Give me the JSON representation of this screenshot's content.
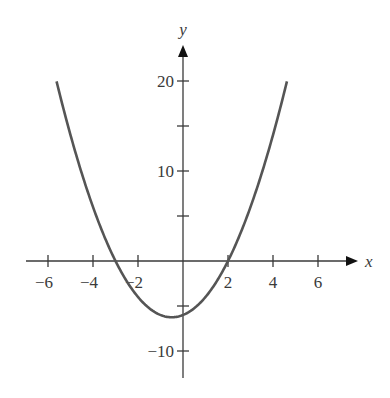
{
  "chart_data": {
    "type": "line",
    "title": "",
    "xlabel": "x",
    "ylabel": "y",
    "function": "y = x^2 + x - 6",
    "xlim": [
      -7,
      7.8
    ],
    "ylim": [
      -13,
      24
    ],
    "x_ticks": [
      -6,
      -4,
      -2,
      2,
      4,
      6
    ],
    "x_tick_labels": [
      "−6",
      "−4",
      "−2",
      "2",
      "4",
      "6"
    ],
    "y_ticks": [
      -10,
      -5,
      5,
      10,
      15,
      20
    ],
    "y_tick_labels": [
      {
        "value": 20,
        "label": "20"
      },
      {
        "value": 10,
        "label": "10"
      },
      {
        "value": -10,
        "label": "−10"
      }
    ],
    "grid": false,
    "legend": null,
    "series": [
      {
        "name": "parabola",
        "color": "#555555",
        "domain": [
          -5.62,
          4.62
        ],
        "x": [
          -5.62,
          -5,
          -4,
          -3,
          -2,
          -1,
          -0.5,
          0,
          1,
          2,
          3,
          4,
          4.62
        ],
        "y": [
          20,
          14,
          6,
          0,
          -4,
          -6,
          -6.25,
          -6,
          -4,
          0,
          6,
          14,
          20
        ]
      }
    ],
    "x_intercepts": [
      -3,
      2
    ],
    "vertex": [
      -0.5,
      -6.25
    ],
    "y_intercept": -6
  },
  "layout": {
    "origin_px": [
      183,
      261
    ],
    "px_per_x_unit": 22.5,
    "px_per_y_unit": 9,
    "x_axis_px": [
      26,
      358
    ],
    "y_axis_px": [
      45,
      378
    ],
    "axis_color": "#3a3a3a",
    "curve_color": "#555555"
  }
}
